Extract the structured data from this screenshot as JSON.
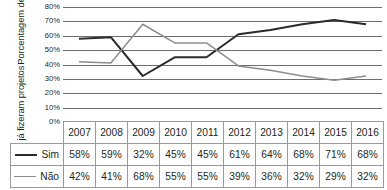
{
  "chart_data": {
    "type": "line",
    "title": "",
    "xlabel": "",
    "ylabel": "Porcentagem de alunos que já fizeram projetos",
    "ylabel_lines": [
      "Porcentagem de alunos",
      "que já fizeram projetos"
    ],
    "categories": [
      "2007",
      "2008",
      "2009",
      "2010",
      "2011",
      "2012",
      "2013",
      "2014",
      "2015",
      "2016"
    ],
    "ytick_labels": [
      "80%",
      "70%",
      "60%",
      "50%",
      "40%",
      "30%",
      "20%",
      "10%",
      "0%"
    ],
    "ylim": [
      0,
      80
    ],
    "ytick_step": 10,
    "grid": "horizontal",
    "legend_position": "table-row-labels",
    "series": [
      {
        "name": "Sim",
        "color": "#2b2b2b",
        "width": 2.0,
        "values": [
          58,
          59,
          32,
          45,
          45,
          61,
          64,
          68,
          71,
          68
        ],
        "labels": [
          "58%",
          "59%",
          "32%",
          "45%",
          "45%",
          "61%",
          "64%",
          "68%",
          "71%",
          "68%"
        ]
      },
      {
        "name": "Não",
        "color": "#8d8d8d",
        "width": 1.5,
        "values": [
          42,
          41,
          68,
          55,
          55,
          39,
          36,
          32,
          29,
          32
        ],
        "labels": [
          "42%",
          "41%",
          "68%",
          "55%",
          "55%",
          "39%",
          "36%",
          "32%",
          "29%",
          "32%"
        ]
      }
    ]
  },
  "table": {
    "header_corner": "",
    "header": [
      "2007",
      "2008",
      "2009",
      "2010",
      "2011",
      "2012",
      "2013",
      "2014",
      "2015",
      "2016"
    ],
    "rows": [
      {
        "label": "Sim",
        "cells": [
          "58%",
          "59%",
          "32%",
          "45%",
          "45%",
          "61%",
          "64%",
          "68%",
          "71%",
          "68%"
        ]
      },
      {
        "label": "Não",
        "cells": [
          "42%",
          "41%",
          "68%",
          "55%",
          "55%",
          "39%",
          "36%",
          "32%",
          "29%",
          "32%"
        ]
      }
    ]
  },
  "colors": {
    "sim_line": "#2b2b2b",
    "nao_line": "#8d8d8d",
    "gridline": "#6e6e6e",
    "table_border": "#9a9a9a",
    "text": "#231f20",
    "background": "#ffffff"
  }
}
